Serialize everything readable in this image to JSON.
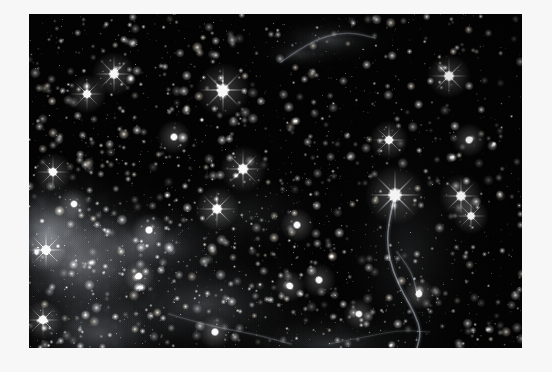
{
  "page": {
    "width": 552,
    "height": 372,
    "background_color": "#f7f7f8",
    "content_type": "photograph"
  },
  "photo": {
    "name": "deep-sky-star-field",
    "alt_text": "Deep space photograph of a dense star field with diffuse nebulosity and a thin curving filament",
    "x": 29,
    "y": 14,
    "width": 493,
    "height": 334,
    "border_color": "#0a0a0a",
    "sky_color": "#030303",
    "star_color": "#ffffff",
    "star_warm_color": "#fff4e2",
    "nebula_color": "#b9bec6",
    "filament_color": "#cfd4da"
  },
  "chart_data": {
    "type": "scatter",
    "title": "",
    "xlabel": "",
    "ylabel": "",
    "xlim": [
      0,
      493
    ],
    "ylim": [
      0,
      334
    ],
    "grid": false,
    "legend": "none",
    "nebula_regions": [
      {
        "name": "lower-left-glow",
        "cx": 55,
        "cy": 250,
        "rx": 130,
        "ry": 105,
        "intensity": 0.52
      },
      {
        "name": "lower-left-glow-2",
        "cx": 20,
        "cy": 215,
        "rx": 85,
        "ry": 70,
        "intensity": 0.58
      },
      {
        "name": "left-mid-band",
        "cx": 120,
        "cy": 232,
        "rx": 120,
        "ry": 48,
        "intensity": 0.34
      },
      {
        "name": "lower-center-sheet",
        "cx": 175,
        "cy": 290,
        "rx": 145,
        "ry": 75,
        "intensity": 0.3
      },
      {
        "name": "bottom-left-pool",
        "cx": 70,
        "cy": 320,
        "rx": 105,
        "ry": 60,
        "intensity": 0.36
      },
      {
        "name": "bottom-center-arc",
        "cx": 300,
        "cy": 330,
        "rx": 130,
        "ry": 42,
        "intensity": 0.24
      },
      {
        "name": "top-center-wisp",
        "cx": 300,
        "cy": 26,
        "rx": 70,
        "ry": 26,
        "intensity": 0.3
      },
      {
        "name": "top-center-wisp-2",
        "cx": 270,
        "cy": 40,
        "rx": 48,
        "ry": 18,
        "intensity": 0.22
      },
      {
        "name": "right-filament-haze",
        "cx": 380,
        "cy": 240,
        "rx": 55,
        "ry": 90,
        "intensity": 0.14
      },
      {
        "name": "center-faint-haze",
        "cx": 215,
        "cy": 200,
        "rx": 110,
        "ry": 55,
        "intensity": 0.12
      }
    ],
    "filaments": [
      {
        "name": "supernova-remnant-thread",
        "points": [
          [
            366,
            181
          ],
          [
            360,
            205
          ],
          [
            358,
            232
          ],
          [
            364,
            258
          ],
          [
            375,
            281
          ],
          [
            386,
            300
          ],
          [
            392,
            318
          ],
          [
            388,
            334
          ]
        ],
        "width": 1.6,
        "intensity": 0.7
      },
      {
        "name": "filament-branch",
        "points": [
          [
            368,
            238
          ],
          [
            379,
            252
          ],
          [
            386,
            268
          ],
          [
            389,
            286
          ]
        ],
        "width": 1.2,
        "intensity": 0.42
      },
      {
        "name": "bottom-left-streak",
        "points": [
          [
            140,
            300
          ],
          [
            180,
            312
          ],
          [
            225,
            320
          ],
          [
            262,
            330
          ]
        ],
        "width": 1.3,
        "intensity": 0.3
      },
      {
        "name": "bottom-right-streak",
        "points": [
          [
            300,
            330
          ],
          [
            340,
            322
          ],
          [
            372,
            316
          ],
          [
            400,
            318
          ]
        ],
        "width": 1.2,
        "intensity": 0.26
      },
      {
        "name": "top-wisp-streak",
        "points": [
          [
            252,
            48
          ],
          [
            272,
            34
          ],
          [
            296,
            22
          ],
          [
            322,
            18
          ],
          [
            346,
            24
          ]
        ],
        "width": 1.5,
        "intensity": 0.4
      }
    ],
    "bright_stars": [
      {
        "x": 194,
        "y": 76,
        "r": 4.2,
        "spikes": true,
        "warm": false
      },
      {
        "x": 85,
        "y": 60,
        "r": 3.4,
        "spikes": true,
        "warm": false
      },
      {
        "x": 58,
        "y": 80,
        "r": 3.0,
        "spikes": true,
        "warm": false
      },
      {
        "x": 214,
        "y": 155,
        "r": 3.6,
        "spikes": true,
        "warm": false
      },
      {
        "x": 188,
        "y": 195,
        "r": 3.4,
        "spikes": true,
        "warm": false
      },
      {
        "x": 366,
        "y": 181,
        "r": 4.6,
        "spikes": true,
        "warm": false
      },
      {
        "x": 432,
        "y": 182,
        "r": 3.4,
        "spikes": true,
        "warm": false
      },
      {
        "x": 442,
        "y": 202,
        "r": 2.8,
        "spikes": true,
        "warm": false
      },
      {
        "x": 420,
        "y": 62,
        "r": 3.4,
        "spikes": true,
        "warm": false
      },
      {
        "x": 360,
        "y": 126,
        "r": 3.0,
        "spikes": true,
        "warm": false
      },
      {
        "x": 440,
        "y": 126,
        "r": 2.6,
        "spikes": false,
        "warm": false
      },
      {
        "x": 145,
        "y": 123,
        "r": 2.6,
        "spikes": false,
        "warm": false
      },
      {
        "x": 24,
        "y": 158,
        "r": 3.0,
        "spikes": true,
        "warm": false
      },
      {
        "x": 17,
        "y": 236,
        "r": 3.2,
        "spikes": true,
        "warm": false
      },
      {
        "x": 14,
        "y": 306,
        "r": 3.0,
        "spikes": true,
        "warm": false
      },
      {
        "x": 268,
        "y": 211,
        "r": 2.6,
        "spikes": false,
        "warm": false
      },
      {
        "x": 290,
        "y": 266,
        "r": 2.6,
        "spikes": false,
        "warm": false
      },
      {
        "x": 261,
        "y": 272,
        "r": 2.4,
        "spikes": false,
        "warm": false
      },
      {
        "x": 120,
        "y": 216,
        "r": 2.6,
        "spikes": false,
        "warm": false
      },
      {
        "x": 45,
        "y": 190,
        "r": 2.4,
        "spikes": false,
        "warm": false
      },
      {
        "x": 390,
        "y": 280,
        "r": 2.4,
        "spikes": false,
        "warm": false
      },
      {
        "x": 330,
        "y": 300,
        "r": 2.4,
        "spikes": false,
        "warm": false
      },
      {
        "x": 186,
        "y": 318,
        "r": 2.6,
        "spikes": false,
        "warm": false
      },
      {
        "x": 110,
        "y": 262,
        "r": 2.4,
        "spikes": false,
        "warm": false
      }
    ],
    "star_count_estimate": 2400,
    "star_size_range_px": [
      0.35,
      4.6
    ]
  }
}
